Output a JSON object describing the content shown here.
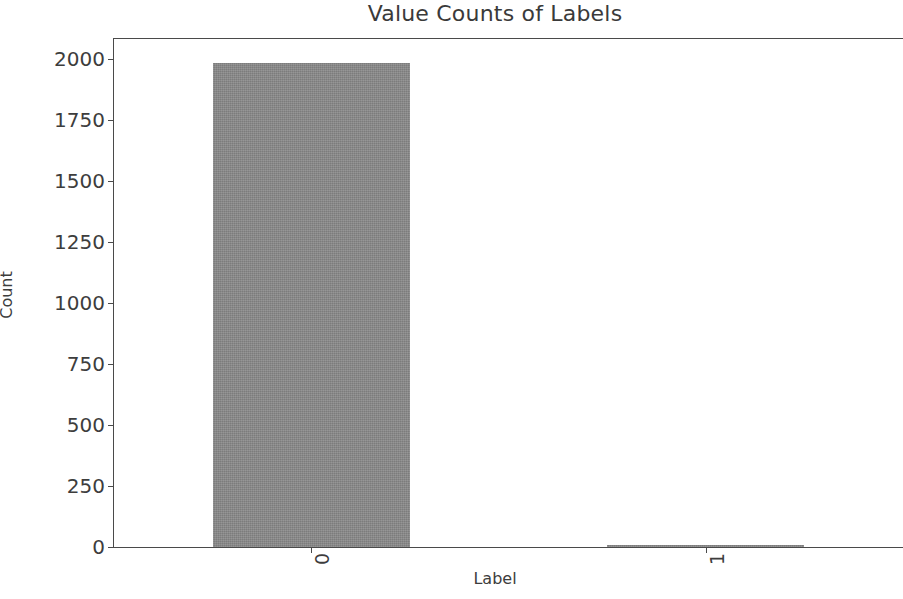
{
  "chart_data": {
    "type": "bar",
    "title": "Value Counts of Labels",
    "xlabel": "Label",
    "ylabel": "Count",
    "categories": [
      "0",
      "1"
    ],
    "values": [
      1980,
      6
    ],
    "series": [
      {
        "name": "Count",
        "values": [
          1980,
          6
        ]
      }
    ],
    "ylim": [
      0,
      2080
    ],
    "yticks": [
      0,
      250,
      500,
      750,
      1000,
      1250,
      1500,
      1750,
      2000
    ],
    "ytick_labels": [
      "0",
      "250",
      "500",
      "750",
      "1000",
      "1250",
      "1500",
      "1750",
      "2000"
    ],
    "xtick_labels": [
      "0",
      "1"
    ],
    "xtick_rotation": 90,
    "grid": false,
    "legend": false,
    "bar_color": "#8a8a8a",
    "axis_color": "#4a4a4a",
    "background_color": "#ffffff",
    "note": "Figure is cropped on the right edge; plot area extends beyond the image."
  }
}
